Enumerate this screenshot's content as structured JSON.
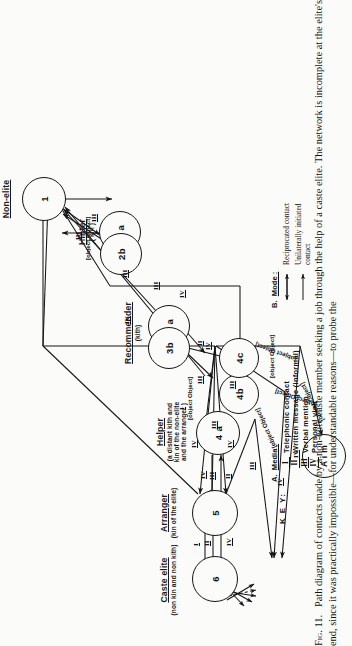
{
  "figure": {
    "label": "Fig. 11.",
    "caption": "Path diagram of contacts made by a non-elite caste member seeking a job through the help of a caste elite. The network is incomplete at the elite's end, since it was practically impossible—for understandable reasons—to probe the"
  },
  "columns": [
    {
      "title": "Caste  elite",
      "subtitle": "(non  kin and non kith)"
    },
    {
      "title": "Arranger",
      "subtitle": "(kin of  the elite)"
    },
    {
      "title": "Helper",
      "subtitle": "(a  distant  kith and\nkin of the non-elite\nand the arranger )"
    },
    {
      "title": "Recommender",
      "subtitle": "(kith)"
    },
    {
      "title": "Hinter",
      "subtitle": "( kin )"
    },
    {
      "title": "Non-elite",
      "subtitle": ""
    }
  ],
  "nodes": [
    {
      "id": "1",
      "label": "1"
    },
    {
      "id": "2a",
      "label": "2 a"
    },
    {
      "id": "2b",
      "label": "2b"
    },
    {
      "id": "3a",
      "label": "3 a"
    },
    {
      "id": "3b",
      "label": "3b"
    },
    {
      "id": "4a",
      "label": "4 a"
    },
    {
      "id": "4b",
      "label": "4b"
    },
    {
      "id": "4c",
      "label": "4c"
    },
    {
      "id": "5",
      "label": "5"
    },
    {
      "id": "6",
      "label": "6"
    },
    {
      "id": "aim",
      "label": "A i m"
    }
  ],
  "annotations": [
    {
      "text": "kith"
    },
    {
      "text": "kith of 3b"
    },
    {
      "text": "kin of 3b"
    },
    {
      "text": "first  attempt"
    },
    {
      "text": "second  attempt"
    },
    {
      "text": "third  attempt"
    },
    {
      "text": "achievement"
    }
  ],
  "edge_labels": [
    "I",
    "II",
    "III",
    "IV"
  ],
  "key": {
    "word": "K E Y:",
    "media": {
      "section": "A.",
      "head": "Media :",
      "items": [
        {
          "num": "I",
          "label": "Telephonic   contact"
        },
        {
          "num": "II",
          "label": "Written message  (informal)"
        },
        {
          "num": "III",
          "label": "Verbal  mention"
        },
        {
          "num": "IV",
          "label": "Personal  visit"
        }
      ]
    },
    "mode": {
      "section": "B.",
      "head": "Mode :",
      "items": [
        {
          "glyph": "double-arrow",
          "label": "Reciprocated    contact"
        },
        {
          "glyph": "single-arrow",
          "label": "Unilaterally  initiated\n                contact"
        }
      ]
    }
  }
}
